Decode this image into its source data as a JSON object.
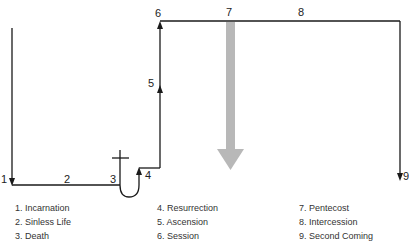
{
  "diagram": {
    "markers": {
      "m1": "1",
      "m2": "2",
      "m3": "3",
      "m4": "4",
      "m5": "5",
      "m6": "6",
      "m7": "7",
      "m8": "8",
      "m9": "9"
    },
    "colors": {
      "line": "#1a1a1a",
      "pentecost_arrow": "#b8b8b8"
    }
  },
  "legend": {
    "columns": [
      [
        "1. Incarnation",
        "2. Sinless Life",
        "3. Death"
      ],
      [
        "4. Resurrection",
        "5. Ascension",
        "6. Session"
      ],
      [
        "7. Pentecost",
        "8. Intercession",
        "9. Second Coming"
      ]
    ]
  }
}
